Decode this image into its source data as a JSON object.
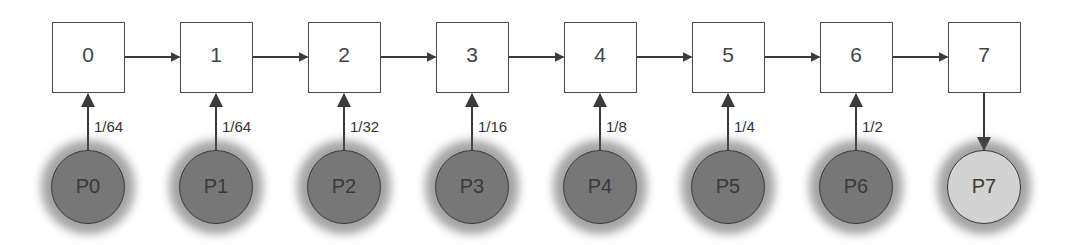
{
  "diagram": {
    "type": "token-ring / probability chain",
    "nodes": [
      {
        "id": "0",
        "label": "0"
      },
      {
        "id": "1",
        "label": "1"
      },
      {
        "id": "2",
        "label": "2"
      },
      {
        "id": "3",
        "label": "3"
      },
      {
        "id": "4",
        "label": "4"
      },
      {
        "id": "5",
        "label": "5"
      },
      {
        "id": "6",
        "label": "6"
      },
      {
        "id": "7",
        "label": "7"
      }
    ],
    "processes": [
      {
        "label": "P0",
        "prob": "1/64",
        "direction": "up",
        "state": "active"
      },
      {
        "label": "P1",
        "prob": "1/64",
        "direction": "up",
        "state": "active"
      },
      {
        "label": "P2",
        "prob": "1/32",
        "direction": "up",
        "state": "active"
      },
      {
        "label": "P3",
        "prob": "1/16",
        "direction": "up",
        "state": "active"
      },
      {
        "label": "P4",
        "prob": "1/8",
        "direction": "up",
        "state": "active"
      },
      {
        "label": "P5",
        "prob": "1/4",
        "direction": "up",
        "state": "active"
      },
      {
        "label": "P6",
        "prob": "1/2",
        "direction": "up",
        "state": "active"
      },
      {
        "label": "P7",
        "prob": "",
        "direction": "down",
        "state": "idle"
      }
    ],
    "colors": {
      "active_process": "#777777",
      "idle_process": "#d2d2d2",
      "stroke": "#4a4a4a",
      "dotted_path": "#999999"
    }
  }
}
